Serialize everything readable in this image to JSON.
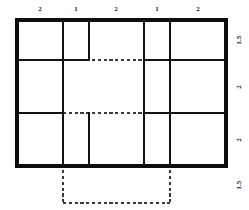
{
  "figure": {
    "kind": "dimensioned-grid-floor-plan",
    "background_color": "#ffffff",
    "solid_line_color": "#121212",
    "dashed_line_color": "#3a3a3a"
  },
  "top_dimensions": [
    {
      "label": "2",
      "x": 40
    },
    {
      "label": "1",
      "x": 76
    },
    {
      "label": "2",
      "x": 116
    },
    {
      "label": "1",
      "x": 157
    },
    {
      "label": "2",
      "x": 198
    }
  ],
  "right_dimensions": [
    {
      "label": "1.5",
      "y": 40
    },
    {
      "label": "2",
      "y": 87
    },
    {
      "label": "2",
      "y": 140
    },
    {
      "label": "1.5",
      "y": 185
    }
  ],
  "grid": {
    "left": 17,
    "right": 226,
    "top": 20,
    "bottom": 166,
    "column_edges": [
      17,
      63,
      89,
      144,
      170,
      226
    ],
    "row_edges": [
      20,
      60,
      113,
      166
    ],
    "columns": 5,
    "rows": 3,
    "column_labels": [
      "2",
      "1",
      "2",
      "1",
      "2"
    ],
    "row_labels": [
      "1.5",
      "2",
      "2"
    ]
  },
  "dashed_overlay": {
    "left": 63,
    "right": 170,
    "top": 60,
    "bottom": 203,
    "label": "1.5"
  },
  "solid_segments": {
    "horizontal": [
      {
        "name": "outer-top",
        "x1": 17,
        "x2": 226,
        "y": 20
      },
      {
        "name": "row1-left",
        "x1": 17,
        "x2": 63,
        "y": 60
      },
      {
        "name": "row1-mid-a",
        "x1": 63,
        "x2": 89,
        "y": 60
      },
      {
        "name": "row1-mid-b",
        "x1": 144,
        "x2": 170,
        "y": 60
      },
      {
        "name": "row1-right",
        "x1": 170,
        "x2": 226,
        "y": 60
      },
      {
        "name": "row2-left",
        "x1": 17,
        "x2": 63,
        "y": 113
      },
      {
        "name": "row2-right",
        "x1": 170,
        "x2": 226,
        "y": 113
      },
      {
        "name": "row2-center",
        "x1": 144,
        "x2": 170,
        "y": 113
      },
      {
        "name": "outer-bottom",
        "x1": 17,
        "x2": 226,
        "y": 166
      }
    ],
    "vertical": [
      {
        "name": "outer-left",
        "y1": 20,
        "y2": 166,
        "x": 17
      },
      {
        "name": "col1",
        "y1": 20,
        "y2": 166,
        "x": 63
      },
      {
        "name": "col2-upper",
        "y1": 20,
        "y2": 60,
        "x": 89
      },
      {
        "name": "col2-lower",
        "y1": 113,
        "y2": 166,
        "x": 89
      },
      {
        "name": "col3-upper",
        "y1": 20,
        "y2": 60,
        "x": 144
      },
      {
        "name": "col3-lower",
        "y1": 60,
        "y2": 166,
        "x": 144
      },
      {
        "name": "col4",
        "y1": 20,
        "y2": 166,
        "x": 170
      },
      {
        "name": "outer-right",
        "y1": 20,
        "y2": 166,
        "x": 226
      }
    ]
  },
  "dashed_segments": {
    "horizontal": [
      {
        "name": "dash-top",
        "x1": 63,
        "x2": 170,
        "y": 60
      },
      {
        "name": "dash-mid",
        "x1": 63,
        "x2": 170,
        "y": 113
      },
      {
        "name": "dash-bottom",
        "x1": 63,
        "x2": 170,
        "y": 203
      }
    ],
    "vertical": [
      {
        "name": "dash-left",
        "y1": 60,
        "y2": 203,
        "x": 63
      },
      {
        "name": "dash-right",
        "y1": 60,
        "y2": 203,
        "x": 170
      }
    ]
  }
}
